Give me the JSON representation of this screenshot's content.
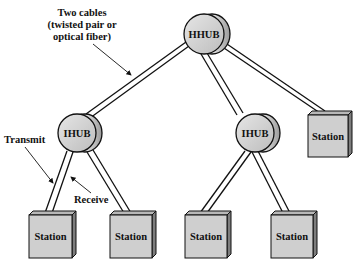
{
  "diagram": {
    "annotations": {
      "cables_label": [
        "Two cables",
        "(twisted pair or",
        "optical fiber)"
      ],
      "transmit_label": "Transmit",
      "receive_label": "Receive"
    },
    "hubs": [
      {
        "id": "hhub",
        "label": "HHUB",
        "cx": 204,
        "cy": 34,
        "r": 20
      },
      {
        "id": "ihub-left",
        "label": "IHUB",
        "cx": 77,
        "cy": 133,
        "r": 19
      },
      {
        "id": "ihub-right",
        "label": "IHUB",
        "cx": 255,
        "cy": 133,
        "r": 19
      }
    ],
    "stations": [
      {
        "id": "station-right-top",
        "label": "Station",
        "x": 308,
        "y": 115,
        "w": 40,
        "h": 42
      },
      {
        "id": "station-1",
        "label": "Station",
        "x": 29,
        "y": 215,
        "w": 43,
        "h": 43
      },
      {
        "id": "station-2",
        "label": "Station",
        "x": 110,
        "y": 215,
        "w": 42,
        "h": 43
      },
      {
        "id": "station-3",
        "label": "Station",
        "x": 185,
        "y": 215,
        "w": 42,
        "h": 43
      },
      {
        "id": "station-4",
        "label": "Station",
        "x": 271,
        "y": 215,
        "w": 42,
        "h": 43
      }
    ],
    "colors": {
      "hub_fill": "#d4d4d4",
      "station_fill": "#cfcfcf",
      "station_side": "#9a9a9a",
      "stroke": "#111111"
    }
  }
}
